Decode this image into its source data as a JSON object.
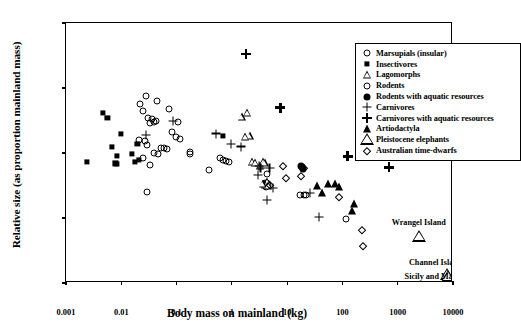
{
  "chart_data": {
    "type": "scatter",
    "title": "",
    "xlabel": "Body mass on mainland (kg)",
    "ylabel": "Relative size (as proportion mainland mass)",
    "xscale": "log",
    "xlim": [
      0.001,
      10000
    ],
    "ylim": [
      0.0,
      2.0
    ],
    "xticks": [
      "0.001",
      "0.01",
      "0.1",
      "1",
      "10",
      "100",
      "1000",
      "10000"
    ],
    "xtick_values": [
      0.001,
      0.01,
      0.1,
      1,
      10,
      100,
      1000,
      10000
    ],
    "yticks": [
      "0.00",
      "0.50",
      "1.00",
      "1.50",
      "2.00"
    ],
    "ytick_values": [
      0.0,
      0.5,
      1.0,
      1.5,
      2.0
    ],
    "grid": false,
    "legend_position": "top-right",
    "series": [
      {
        "name": "Marsupials (insular)",
        "marker": "open-circle",
        "points": [
          [
            0.022,
            1.38
          ],
          [
            0.028,
            1.44
          ],
          [
            0.045,
            1.4
          ],
          [
            0.0245,
            1.32
          ],
          [
            0.031,
            1.27
          ],
          [
            0.036,
            1.26
          ],
          [
            0.042,
            1.25
          ],
          [
            0.074,
            1.34
          ],
          [
            0.082,
            1.16
          ],
          [
            0.105,
            1.24
          ],
          [
            0.098,
            1.12
          ],
          [
            0.115,
            1.11
          ],
          [
            0.0265,
            1.09
          ],
          [
            0.0205,
            1.1
          ],
          [
            0.0295,
            1.06
          ],
          [
            0.0335,
            1.23
          ],
          [
            0.0385,
            1.24
          ],
          [
            0.052,
            1.04
          ],
          [
            0.06,
            1.04
          ],
          [
            0.068,
            1.03
          ],
          [
            0.047,
            0.99
          ],
          [
            0.0385,
            1.0
          ],
          [
            0.0245,
            0.96
          ],
          [
            0.0335,
            0.91
          ],
          [
            0.0295,
            0.7
          ],
          [
            0.175,
            1.01
          ],
          [
            0.178,
            0.99
          ],
          [
            0.38,
            0.87
          ],
          [
            0.7,
            0.95
          ],
          [
            0.78,
            0.94
          ],
          [
            0.62,
            0.96
          ],
          [
            0.88,
            0.93
          ],
          [
            4.3,
            0.84
          ],
          [
            4.4,
            0.77
          ],
          [
            3.9,
            0.77
          ],
          [
            4.6,
            0.755
          ],
          [
            4.2,
            0.74
          ],
          [
            17.0,
            0.68
          ],
          [
            20.0,
            0.675
          ],
          [
            22.0,
            0.68
          ],
          [
            115.0,
            0.49
          ]
        ]
      },
      {
        "name": "Insectivores",
        "marker": "filled-square",
        "points": [
          [
            0.0024,
            0.93
          ],
          [
            0.0047,
            1.31
          ],
          [
            0.0056,
            1.27
          ],
          [
            0.0098,
            1.15
          ],
          [
            0.0068,
            1.05
          ],
          [
            0.0082,
            0.98
          ],
          [
            0.0078,
            0.92
          ],
          [
            0.0082,
            0.915
          ],
          [
            0.0195,
            1.07
          ],
          [
            0.0155,
            0.99
          ],
          [
            0.0175,
            0.93
          ],
          [
            0.0205,
            0.95
          ],
          [
            0.7,
            1.13
          ]
        ]
      },
      {
        "name": "Lagomorphs",
        "marker": "open-triangle",
        "points": [
          [
            1.5,
            1.28
          ],
          [
            1.9,
            1.31
          ],
          [
            2.1,
            1.13
          ],
          [
            1.75,
            1.12
          ],
          [
            2.35,
            0.93
          ],
          [
            2.6,
            0.92
          ],
          [
            3.2,
            0.9
          ],
          [
            3.7,
            0.93
          ],
          [
            3.9,
            0.92
          ],
          [
            4.3,
            0.78
          ],
          [
            4.0,
            0.755
          ],
          [
            3.6,
            0.76
          ],
          [
            4.5,
            0.745
          ]
        ]
      },
      {
        "name": "Rodents",
        "marker": "open-circle",
        "points": []
      },
      {
        "name": "Rodents with aquatic resources",
        "marker": "filled-circle",
        "points": [
          [
            18.0,
            0.9
          ],
          [
            18.5,
            0.89
          ],
          [
            19.0,
            0.875
          ]
        ]
      },
      {
        "name": "Carnivores",
        "marker": "thin-plus",
        "points": [
          [
            0.085,
            1.245
          ],
          [
            0.0285,
            1.14
          ],
          [
            0.52,
            1.15
          ],
          [
            0.95,
            1.07
          ],
          [
            1.45,
            1.05
          ],
          [
            3.1,
            0.9
          ],
          [
            3.3,
            0.885
          ],
          [
            3.0,
            0.83
          ],
          [
            5.6,
            0.73
          ],
          [
            4.4,
            0.64
          ],
          [
            26.0,
            0.69
          ],
          [
            37.0,
            0.51
          ],
          [
            4.8,
            0.885
          ]
        ]
      },
      {
        "name": "Carnivores with aquatic resources",
        "marker": "bold-plus",
        "points": [
          [
            1.8,
            1.76
          ],
          [
            7.5,
            1.35
          ],
          [
            125.0,
            0.975
          ],
          [
            700.0,
            0.89
          ]
        ]
      },
      {
        "name": "Artiodactyla",
        "marker": "filled-triangle",
        "points": [
          [
            35.0,
            0.745
          ],
          [
            55.0,
            0.765
          ],
          [
            72.0,
            0.765
          ],
          [
            85.0,
            0.735
          ],
          [
            42.0,
            0.695
          ],
          [
            150.0,
            0.555
          ],
          [
            165.0,
            0.61
          ]
        ]
      },
      {
        "name": "Pleistocene elephants",
        "marker": "big-open-triangle",
        "points": [
          [
            2400.0,
            0.355
          ],
          [
            7800.0,
            0.06
          ],
          [
            8200.0,
            0.045
          ]
        ]
      },
      {
        "name": "Australian time-dwarfs",
        "marker": "open-diamond",
        "points": [
          [
            8.5,
            0.9
          ],
          [
            9.5,
            0.81
          ],
          [
            17.5,
            0.825
          ],
          [
            4.9,
            0.755
          ],
          [
            20.0,
            0.885
          ],
          [
            85.0,
            0.665
          ],
          [
            230.0,
            0.41
          ],
          [
            235.0,
            0.285
          ]
        ]
      }
    ],
    "annotations": [
      {
        "text": "Wrangel Island",
        "x": 2400.0,
        "y": 0.47
      },
      {
        "text": "Channel Islands",
        "x": 5200.0,
        "y": 0.165
      },
      {
        "text": "Sicily and Malta",
        "x": 4400.0,
        "y": 0.055
      }
    ]
  },
  "legend": {
    "items": [
      {
        "label": "Marsupials (insular)",
        "marker": "open-circle"
      },
      {
        "label": "Insectivores",
        "marker": "filled-square"
      },
      {
        "label": "Lagomorphs",
        "marker": "open-triangle"
      },
      {
        "label": "Rodents",
        "marker": "open-circle"
      },
      {
        "label": "Rodents with aquatic resources",
        "marker": "filled-circle"
      },
      {
        "label": "Carnivores",
        "marker": "thin-plus"
      },
      {
        "label": "Carnivores with aquatic resources",
        "marker": "bold-plus"
      },
      {
        "label": "Artiodactyla",
        "marker": "filled-triangle"
      },
      {
        "label": "Pleistocene elephants",
        "marker": "big-open-triangle"
      },
      {
        "label": "Australian time-dwarfs",
        "marker": "open-diamond"
      }
    ]
  },
  "colors": {
    "axis": "#000000",
    "marker": "#000000",
    "background": "#ffffff"
  }
}
